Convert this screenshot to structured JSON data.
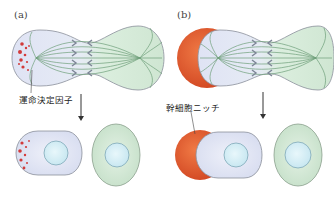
{
  "panels": [
    {
      "id": "a",
      "label": "(a)",
      "callout": "運命決定因子",
      "description": "Asymmetric division driven by intrinsic fate determinants localized at one pole"
    },
    {
      "id": "b",
      "label": "(b)",
      "callout": "幹細胞ニッチ",
      "description": "Asymmetric division driven by contact with the stem cell niche"
    }
  ],
  "colors": {
    "cell_blue": "#dde3f3",
    "cell_green": "#cfe6d2",
    "nucleus": "#d4eef6",
    "niche_red": "#e0552a",
    "determinant_red": "#d23a3a",
    "spindle": "#6f9f7a",
    "arrow": "#333333"
  }
}
